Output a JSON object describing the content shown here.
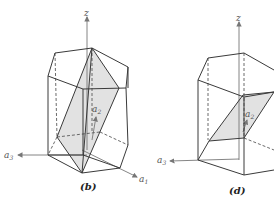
{
  "figures": [
    {
      "id": "b",
      "caption": "(b)",
      "axes": {
        "z": "z",
        "a1": "a",
        "a1_sub": "1",
        "a2": "a",
        "a2_sub": "2",
        "a3": "a",
        "a3_sub": "3"
      },
      "description": "Hexagonal prism with shaded diagonal plane through top-back vertex to bottom-front vertex"
    },
    {
      "id": "d",
      "caption": "(d)",
      "axes": {
        "z": "z",
        "a2": "a",
        "a2_sub": "2",
        "a3": "a",
        "a3_sub": "3"
      },
      "description": "Hexagonal prism with shaded inclined parallelogram plane"
    }
  ],
  "colors": {
    "edge": "#3a3a3a",
    "plane": "#e2e2e2",
    "axis": "#777777"
  }
}
